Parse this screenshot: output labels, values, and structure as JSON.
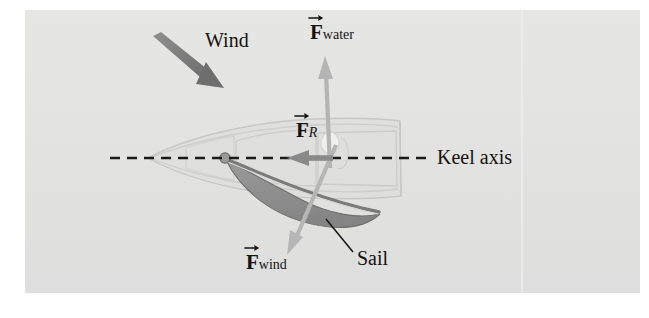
{
  "figure": {
    "background_color": "#ffffff",
    "panel_color": "#e3e3e1",
    "panel_rect": [
      25,
      10,
      615,
      283
    ]
  },
  "labels": {
    "wind": "Wind",
    "keel_axis": "Keel axis",
    "sail": "Sail",
    "f_water": {
      "symbol": "F",
      "subscript": "water",
      "vector": true
    },
    "f_wind": {
      "symbol": "F",
      "subscript": "wind",
      "vector": true
    },
    "f_resultant": {
      "symbol": "F",
      "subscript": "R",
      "vector": true,
      "subscript_italic": true
    }
  },
  "colors": {
    "panel": "#e3e3e1",
    "wind_arrow": "#7d7d7d",
    "force_arrow_light": "#b3b3b3",
    "force_arrow_dark": "#8a8a8a",
    "sail_fill": "#8d8d8d",
    "sail_edge": "#6f6f6f",
    "hull_line": "#c9c9c7",
    "keel_dash": "#1a1a1a",
    "leader_line": "#1a1a1a",
    "text": "#15130f"
  },
  "vectors": [
    {
      "name": "wind",
      "label": "Wind",
      "style": "tapered",
      "color": "#7d7d7d",
      "from": [
        154,
        37
      ],
      "to": [
        224,
        88
      ],
      "direction_deg": 36
    },
    {
      "name": "f_water",
      "label": "F_water",
      "style": "straight",
      "color": "#b3b3b3",
      "from": [
        329,
        165
      ],
      "to": [
        325,
        58
      ],
      "direction_deg": -88
    },
    {
      "name": "f_wind",
      "label": "F_wind",
      "style": "straight",
      "color": "#b3b3b3",
      "from": [
        334,
        148
      ],
      "to": [
        288,
        254
      ],
      "direction_deg": 114
    },
    {
      "name": "f_resultant",
      "label": "F_R",
      "style": "straight",
      "color": "#8a8a8a",
      "from": [
        333,
        158
      ],
      "to": [
        288,
        158
      ],
      "direction_deg": 180
    }
  ],
  "annotations": {
    "keel_axis_line": {
      "from": [
        110,
        158
      ],
      "to": [
        430,
        158
      ],
      "dashed": true
    },
    "sail_leader_line": {
      "from": [
        326,
        219
      ],
      "to": [
        352,
        252
      ]
    }
  },
  "label_positions": {
    "wind": [
      205,
      32
    ],
    "f_water": [
      310,
      20
    ],
    "f_resultant": [
      296,
      118
    ],
    "f_wind": [
      246,
      250
    ],
    "keel_axis": [
      437,
      147
    ],
    "sail": [
      357,
      250
    ]
  }
}
